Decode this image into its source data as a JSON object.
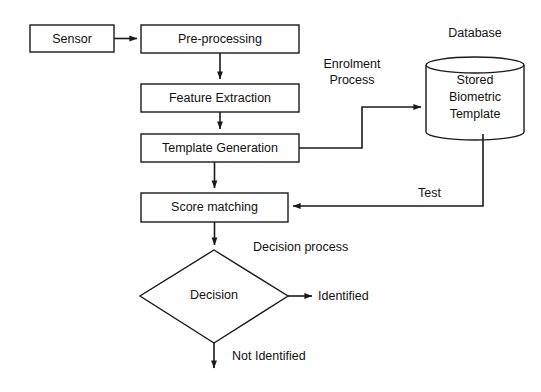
{
  "diagram": {
    "type": "flowchart",
    "background_color": "#ffffff",
    "line_color": "#1a1a1a",
    "text_color": "#111111",
    "nodes": [
      {
        "id": "sensor",
        "label": "Sensor",
        "shape": "rect"
      },
      {
        "id": "preproc",
        "label": "Pre-processing",
        "shape": "rect"
      },
      {
        "id": "feature",
        "label": "Feature Extraction",
        "shape": "rect"
      },
      {
        "id": "template",
        "label": "Template Generation",
        "shape": "rect"
      },
      {
        "id": "score",
        "label": "Score matching",
        "shape": "rect"
      },
      {
        "id": "decision",
        "label": "Decision",
        "shape": "diamond"
      },
      {
        "id": "database",
        "label_line1": "Stored",
        "label_line2": "Biometric",
        "label_line3": "Template",
        "shape": "cylinder"
      }
    ],
    "labels": {
      "database_title": "Database",
      "enrolment_line1": "Enrolment",
      "enrolment_line2": "Process",
      "test": "Test",
      "decision_process": "Decision process",
      "identified": "Identified",
      "not_identified": "Not Identified"
    },
    "edges": [
      {
        "from": "sensor",
        "to": "preproc",
        "label": ""
      },
      {
        "from": "preproc",
        "to": "feature",
        "label": ""
      },
      {
        "from": "feature",
        "to": "template",
        "label": ""
      },
      {
        "from": "template",
        "to": "database",
        "label": "Enrolment Process"
      },
      {
        "from": "template",
        "to": "score",
        "label": ""
      },
      {
        "from": "database",
        "to": "score",
        "label": "Test"
      },
      {
        "from": "score",
        "to": "decision",
        "label": ""
      },
      {
        "from": "decision",
        "to": "identified",
        "label": "Identified"
      },
      {
        "from": "decision",
        "to": "not-identified",
        "label": "Not Identified"
      }
    ]
  }
}
